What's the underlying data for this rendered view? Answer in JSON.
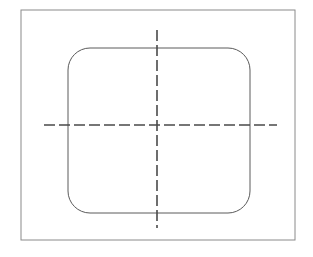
{
  "canvas": {
    "width": 313,
    "height": 257,
    "background_color": "#ffffff",
    "title": "Rounded Rectangle Outline with Centerlines"
  },
  "figure": {
    "outer_frame": {
      "name": "outer-border-rectangle",
      "x": 21,
      "y": 10,
      "width": 274,
      "height": 230,
      "stroke_color": "#8a8a8a",
      "stroke_width": 1,
      "fill": "none",
      "corner_radius": 0
    },
    "rounded_rect": {
      "name": "rounded-rectangle-outline",
      "x": 68,
      "y": 48,
      "width": 182,
      "height": 165,
      "corner_radius": 22,
      "stroke_color": "#5a5a5a",
      "stroke_width": 1,
      "fill": "none"
    },
    "horizontal_centerline": {
      "name": "horizontal-centerline",
      "x1": 44,
      "y1": 125,
      "x2": 277,
      "y2": 125,
      "stroke_color": "#4a4a4a",
      "stroke_width": 1.6,
      "dash_pattern": "11 4"
    },
    "vertical_centerline": {
      "name": "vertical-centerline",
      "x1": 157,
      "y1": 30,
      "x2": 157,
      "y2": 228,
      "stroke_color": "#4a4a4a",
      "stroke_width": 1.6,
      "dash_pattern": "11 4"
    },
    "center_point": {
      "name": "centerline-intersection",
      "x": 157,
      "y": 125
    }
  }
}
